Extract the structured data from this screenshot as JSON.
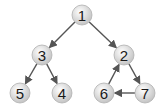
{
  "diagram": {
    "type": "directed-graph",
    "nodes": [
      {
        "id": "1",
        "label": "1",
        "x": 82,
        "y": 15
      },
      {
        "id": "3",
        "label": "3",
        "x": 42,
        "y": 55
      },
      {
        "id": "2",
        "label": "2",
        "x": 124,
        "y": 55
      },
      {
        "id": "5",
        "label": "5",
        "x": 20,
        "y": 93
      },
      {
        "id": "4",
        "label": "4",
        "x": 62,
        "y": 93
      },
      {
        "id": "6",
        "label": "6",
        "x": 104,
        "y": 93
      },
      {
        "id": "7",
        "label": "7",
        "x": 145,
        "y": 93
      }
    ],
    "edges": [
      {
        "from": "1",
        "to": "3"
      },
      {
        "from": "1",
        "to": "2"
      },
      {
        "from": "3",
        "to": "5"
      },
      {
        "from": "3",
        "to": "4"
      },
      {
        "from": "2",
        "to": "7"
      },
      {
        "from": "7",
        "to": "6"
      },
      {
        "from": "6",
        "to": "2"
      }
    ],
    "colors": {
      "node_fill": "#d9d9d9",
      "node_stroke": "#b0b0b0",
      "edge": "#555555"
    }
  }
}
